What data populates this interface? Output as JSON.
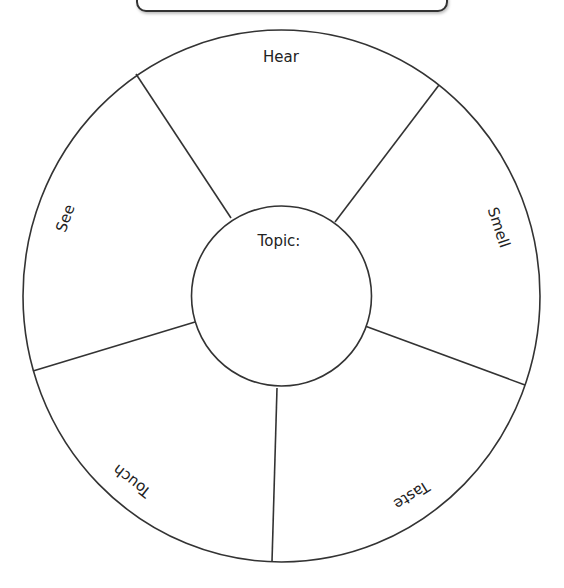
{
  "title_box": {
    "text": ""
  },
  "wheel": {
    "center_label": "Topic:",
    "sections": [
      {
        "name": "hear",
        "label": "Hear"
      },
      {
        "name": "smell",
        "label": "Smell"
      },
      {
        "name": "taste",
        "label": "Taste"
      },
      {
        "name": "touch",
        "label": "Touch"
      },
      {
        "name": "see",
        "label": "See"
      }
    ]
  },
  "colors": {
    "stroke": "#333333",
    "text": "#222222",
    "background": "#ffffff"
  }
}
